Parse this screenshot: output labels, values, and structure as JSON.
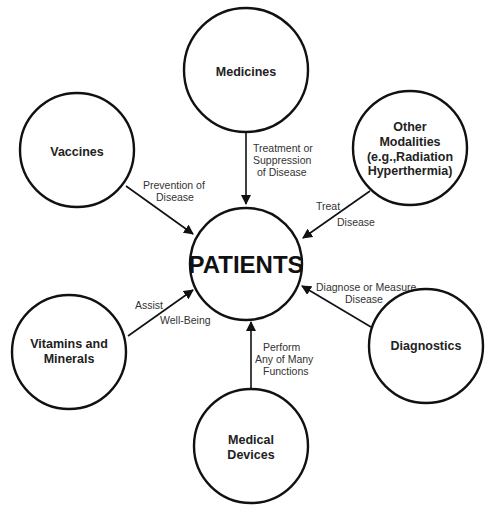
{
  "diagram": {
    "center": {
      "label": "PATIENTS"
    },
    "nodes": [
      {
        "id": "medicines",
        "lines": [
          "Medicines"
        ]
      },
      {
        "id": "vaccines",
        "lines": [
          "Vaccines"
        ]
      },
      {
        "id": "other-modalities",
        "lines": [
          "Other",
          "Modalities",
          "(e.g.,Radiation",
          "Hyperthermia)"
        ]
      },
      {
        "id": "vitamins-minerals",
        "lines": [
          "Vitamins and",
          "Minerals"
        ]
      },
      {
        "id": "diagnostics",
        "lines": [
          "Diagnostics"
        ]
      },
      {
        "id": "medical-devices",
        "lines": [
          "Medical",
          "Devices"
        ]
      }
    ],
    "edges": [
      {
        "from": "medicines",
        "to": "patients",
        "label_lines": [
          "Treatment or",
          "Suppression",
          "of Disease"
        ]
      },
      {
        "from": "vaccines",
        "to": "patients",
        "label_lines": [
          "Prevention of",
          "Disease"
        ]
      },
      {
        "from": "other-modalities",
        "to": "patients",
        "label_lines": [
          "Treat",
          "Disease"
        ]
      },
      {
        "from": "vitamins-minerals",
        "to": "patients",
        "label_lines": [
          "Assist",
          "Well-Being"
        ]
      },
      {
        "from": "diagnostics",
        "to": "patients",
        "label_lines": [
          "Diagnose or Measure",
          "Disease"
        ]
      },
      {
        "from": "medical-devices",
        "to": "patients",
        "label_lines": [
          "Perform",
          "Any of Many",
          "Functions"
        ]
      }
    ]
  }
}
